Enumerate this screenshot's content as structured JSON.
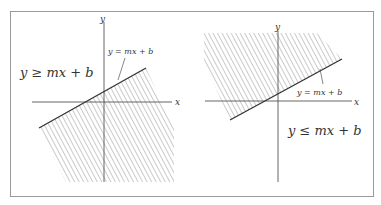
{
  "figure": {
    "border_color": "#9a9a9a",
    "axis_color": "#555555",
    "hatch_color": "#8a8a8a",
    "line_color": "#333333",
    "left_panel": {
      "region_label": "y ≥ mx + b",
      "line_label": "y = mx + b",
      "x_axis_label": "x",
      "y_axis_label": "y",
      "shaded_side": "above"
    },
    "right_panel": {
      "region_label": "y ≤ mx + b",
      "line_label": "y = mx + b",
      "x_axis_label": "x",
      "y_axis_label": "y",
      "shaded_side": "below"
    }
  }
}
